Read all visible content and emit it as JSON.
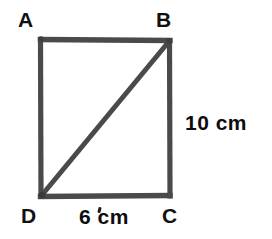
{
  "figure": {
    "background_color": "#ffffff",
    "stroke_color": "#4a4a4a",
    "label_color": "#111111",
    "stroke_width": 5,
    "vertices": [
      {
        "id": "A",
        "label": "A",
        "x": 41,
        "y": 38,
        "position": "top-left"
      },
      {
        "id": "B",
        "label": "B",
        "x": 170,
        "y": 40,
        "position": "top-right"
      },
      {
        "id": "C",
        "label": "C",
        "x": 170,
        "y": 196,
        "position": "bottom-right"
      },
      {
        "id": "D",
        "label": "D",
        "x": 41,
        "y": 196,
        "position": "bottom-left"
      }
    ],
    "edges": [
      {
        "id": "AB",
        "from": "A",
        "to": "B",
        "kind": "side"
      },
      {
        "id": "BC",
        "from": "B",
        "to": "C",
        "kind": "side"
      },
      {
        "id": "CD",
        "from": "C",
        "to": "D",
        "kind": "side"
      },
      {
        "id": "DA",
        "from": "D",
        "to": "A",
        "kind": "side"
      },
      {
        "id": "DB",
        "from": "D",
        "to": "B",
        "kind": "diagonal"
      }
    ],
    "measurements": [
      {
        "id": "BC",
        "edge": "BC",
        "text": "10 cm",
        "value": 10,
        "unit": "cm",
        "side": "right"
      },
      {
        "id": "DC",
        "edge": "DC",
        "text": "6 cm",
        "value": 6,
        "unit": "cm",
        "side": "bottom"
      }
    ]
  }
}
